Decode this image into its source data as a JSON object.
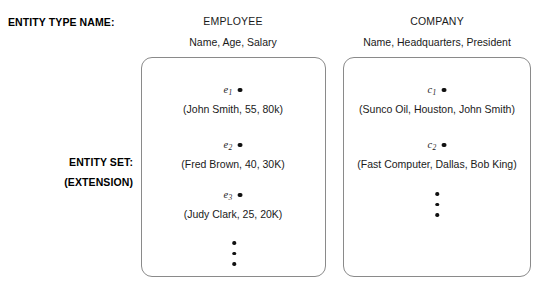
{
  "diagram": {
    "title_caption": "ENTITY TYPE NAME:",
    "set_caption_line1": "ENTITY SET:",
    "set_caption_line2": "(EXTENSION)",
    "ellipsis_glyph": "vertical-ellipsis"
  },
  "entity_types": [
    {
      "name": "EMPLOYEE",
      "attributes": "Name, Age, Salary",
      "instances": [
        {
          "id": "e",
          "subscript": "1",
          "values": "(John Smith, 55, 80k)"
        },
        {
          "id": "e",
          "subscript": "2",
          "values": "(Fred Brown, 40, 30K)"
        },
        {
          "id": "e",
          "subscript": "3",
          "values": "(Judy Clark, 25, 20K)"
        }
      ],
      "has_more": true
    },
    {
      "name": "COMPANY",
      "attributes": "Name, Headquarters, President",
      "instances": [
        {
          "id": "c",
          "subscript": "1",
          "values": "(Sunco Oil, Houston, John Smith)"
        },
        {
          "id": "c",
          "subscript": "2",
          "values": "(Fast Computer, Dallas, Bob King)"
        }
      ],
      "has_more": true
    }
  ],
  "colors": {
    "background": "#ffffff",
    "text": "#1a1a1a",
    "box_border": "#8a8a8a",
    "dot": "#111111"
  }
}
